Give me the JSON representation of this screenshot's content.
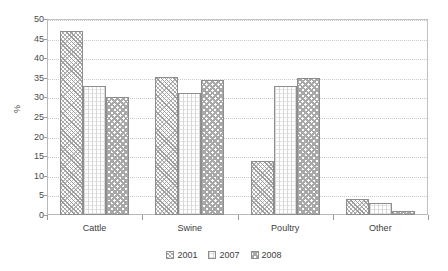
{
  "chart_data": {
    "type": "bar",
    "title": "",
    "xlabel": "",
    "ylabel": "%",
    "categories": [
      "Cattle",
      "Swine",
      "Poultry",
      "Other"
    ],
    "series": [
      {
        "name": "2001",
        "values": [
          47,
          35.3,
          13.7,
          4
        ]
      },
      {
        "name": "2007",
        "values": [
          33,
          31,
          33,
          3
        ]
      },
      {
        "name": "2008",
        "values": [
          30,
          34.5,
          35,
          1
        ]
      }
    ],
    "ylim": [
      0,
      50
    ],
    "ytick_step": 5,
    "yticks": [
      0,
      5,
      10,
      15,
      20,
      25,
      30,
      35,
      40,
      45,
      50
    ],
    "ytick_labels": [
      "0",
      "5",
      "10",
      "15",
      "20",
      "25",
      "30",
      "35",
      "40",
      "45",
      "50"
    ],
    "grid": true,
    "grid_axis": "y",
    "legend_position": "bottom",
    "legend_entries": [
      "2001",
      "2007",
      "2008"
    ],
    "colors": {
      "series_2001": "#9d9d9d",
      "series_2007": "#d8d8d8",
      "series_2008": "#a8a8a8",
      "axis": "#9a9a9a",
      "grid": "#c9c9c9",
      "text": "#3d3d3d",
      "background": "#ffffff"
    }
  }
}
